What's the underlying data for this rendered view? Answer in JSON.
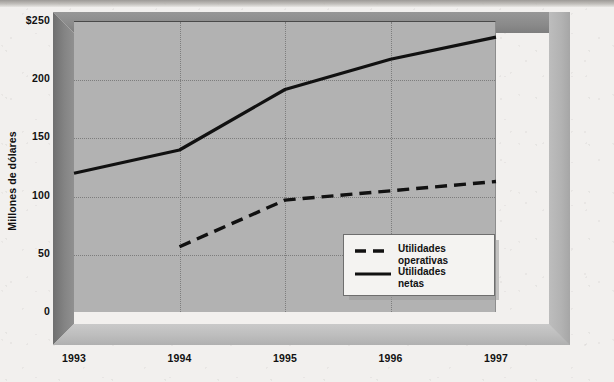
{
  "chart_data": {
    "type": "line",
    "title": "",
    "xlabel": "",
    "ylabel": "Millones de dólares",
    "x": [
      "1993",
      "1994",
      "1995",
      "1996",
      "1997"
    ],
    "categories": [
      "1993",
      "1994",
      "1995",
      "1996",
      "1997"
    ],
    "ylim": [
      0,
      250
    ],
    "yticks": [
      0,
      50,
      100,
      150,
      200,
      250
    ],
    "ytick_labels": [
      "0",
      "50",
      "100",
      "150",
      "200",
      "$250"
    ],
    "grid": "dotted both axes",
    "legend_position": "inside bottom-right",
    "series": [
      {
        "name": "Utilidades operativas",
        "style": "dashed",
        "color": "#111111",
        "x": [
          "1994",
          "1995",
          "1996",
          "1997"
        ],
        "values": [
          57,
          97,
          105,
          113
        ]
      },
      {
        "name": "Utilidades netas",
        "style": "solid",
        "color": "#111111",
        "x": [
          "1993",
          "1994",
          "1995",
          "1996",
          "1997"
        ],
        "values": [
          120,
          140,
          192,
          218,
          237
        ]
      }
    ]
  },
  "axis": {
    "y_title": "Millones de dólares",
    "y_ticks": [
      {
        "label": "$250",
        "value": 250
      },
      {
        "label": "200",
        "value": 200
      },
      {
        "label": "150",
        "value": 150
      },
      {
        "label": "100",
        "value": 100
      },
      {
        "label": "50",
        "value": 50
      },
      {
        "label": "0",
        "value": 0
      }
    ],
    "x_ticks": [
      {
        "label": "1993"
      },
      {
        "label": "1994"
      },
      {
        "label": "1995"
      },
      {
        "label": "1996"
      },
      {
        "label": "1997"
      }
    ]
  },
  "legend": {
    "items": [
      {
        "label_line1": "Utilidades",
        "label_line2": "operativas",
        "style": "dashed"
      },
      {
        "label_line1": "Utilidades",
        "label_line2": "netas",
        "style": "solid"
      }
    ]
  },
  "colors": {
    "plot_background": "#b2b2b2",
    "line": "#111111",
    "grid": "#7d7d7d",
    "frame_top": "#8a8a8a",
    "frame_left": "#848484",
    "frame_bottom": "#bdbdbd",
    "legend_background": "#f4f3f1",
    "page_background": "#f2f0ee"
  }
}
